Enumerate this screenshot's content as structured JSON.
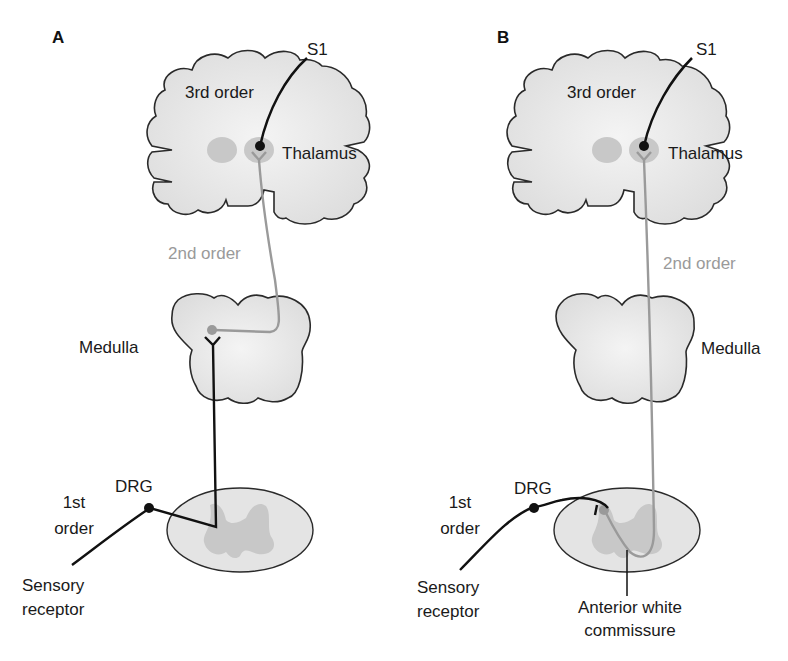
{
  "figure": {
    "panels": [
      {
        "id": "A",
        "label": "A",
        "labels": {
          "s1": "S1",
          "third_order": "3rd order",
          "thalamus": "Thalamus",
          "second_order": "2nd order",
          "medulla": "Medulla",
          "drg": "DRG",
          "first_order_line1": "1st",
          "first_order_line2": "order",
          "receptor_line1": "Sensory",
          "receptor_line2": "receptor"
        }
      },
      {
        "id": "B",
        "label": "B",
        "labels": {
          "s1": "S1",
          "third_order": "3rd order",
          "thalamus": "Thalamus",
          "second_order": "2nd order",
          "medulla": "Medulla",
          "drg": "DRG",
          "first_order_line1": "1st",
          "first_order_line2": "order",
          "receptor_line1": "Sensory",
          "receptor_line2": "receptor",
          "commissure_line1": "Anterior white",
          "commissure_line2": "commissure"
        }
      }
    ],
    "colors": {
      "tissue_fill": "#e6e6e6",
      "outline": "#2a2a2a",
      "first_order_neuron": "#111111",
      "second_order_neuron": "#9a9a9a",
      "third_order_neuron": "#111111",
      "nucleus": "#c4c4c4"
    }
  }
}
